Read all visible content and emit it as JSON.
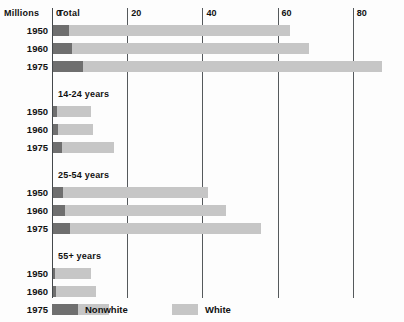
{
  "axis": {
    "unit_label": "Millions",
    "ticks": [
      {
        "label": "0",
        "value": 0
      },
      {
        "label": "20",
        "value": 20
      },
      {
        "label": "40",
        "value": 40
      },
      {
        "label": "60",
        "value": 60
      },
      {
        "label": "80",
        "value": 80
      }
    ]
  },
  "legend": {
    "items": [
      {
        "label": "Nonwhite",
        "color": "#6f6f6f"
      },
      {
        "label": "White",
        "color": "#c6c6c6"
      }
    ]
  },
  "groups": [
    {
      "title": "Total",
      "rows": [
        {
          "label": "1950",
          "nonwhite": 4.3,
          "white": 58.7,
          "total": 63.0
        },
        {
          "label": "1960",
          "nonwhite": 5.0,
          "white": 63.0,
          "total": 68.0
        },
        {
          "label": "1975",
          "nonwhite": 8.0,
          "white": 79.5,
          "total": 87.5
        }
      ]
    },
    {
      "title": "14-24 years",
      "rows": [
        {
          "label": "1950",
          "nonwhite": 1.1,
          "white": 9.0,
          "total": 10.1
        },
        {
          "label": "1960",
          "nonwhite": 1.2,
          "white": 9.4,
          "total": 10.6
        },
        {
          "label": "1975",
          "nonwhite": 2.4,
          "white": 13.8,
          "total": 16.2
        }
      ]
    },
    {
      "title": "25-54 years",
      "rows": [
        {
          "label": "1950",
          "nonwhite": 2.7,
          "white": 38.5,
          "total": 41.2
        },
        {
          "label": "1960",
          "nonwhite": 3.1,
          "white": 42.9,
          "total": 46.0
        },
        {
          "label": "1975",
          "nonwhite": 4.4,
          "white": 50.9,
          "total": 55.3
        }
      ]
    },
    {
      "title": "55+ years",
      "rows": [
        {
          "label": "1950",
          "nonwhite": 0.6,
          "white": 9.5,
          "total": 10.1
        },
        {
          "label": "1960",
          "nonwhite": 0.8,
          "white": 10.7,
          "total": 11.5
        },
        {
          "label": "1975",
          "nonwhite": 0.9,
          "white": 14.0,
          "total": 14.9
        }
      ]
    }
  ],
  "chart_data": {
    "type": "bar",
    "orientation": "horizontal",
    "stacked": true,
    "title": "",
    "xlabel": "Millions",
    "ylabel": "",
    "xlim": [
      0,
      94
    ],
    "xticks": [
      0,
      20,
      40,
      60,
      80
    ],
    "grid": "vertical",
    "legend_position": "bottom-left",
    "series": [
      {
        "name": "Nonwhite",
        "color": "#6f6f6f"
      },
      {
        "name": "White",
        "color": "#c6c6c6"
      }
    ],
    "group_labels": [
      "Total",
      "14-24 years",
      "25-54 years",
      "55+ years"
    ],
    "categories": [
      "Total 1950",
      "Total 1960",
      "Total 1975",
      "14-24 years 1950",
      "14-24 years 1960",
      "14-24 years 1975",
      "25-54 years 1950",
      "25-54 years 1960",
      "25-54 years 1975",
      "55+ years 1950",
      "55+ years 1960",
      "55+ years 1975"
    ],
    "values": {
      "Nonwhite": [
        4.3,
        5.0,
        8.0,
        1.1,
        1.2,
        2.4,
        2.7,
        3.1,
        4.4,
        0.6,
        0.8,
        0.9
      ],
      "White": [
        58.7,
        63.0,
        79.5,
        9.0,
        9.4,
        13.8,
        38.5,
        42.9,
        50.9,
        9.5,
        10.7,
        14.0
      ]
    },
    "totals": [
      63.0,
      68.0,
      87.5,
      10.1,
      10.6,
      16.2,
      41.2,
      46.0,
      55.3,
      10.1,
      11.5,
      14.9
    ]
  },
  "layout": {
    "plot_left": 52,
    "plot_top": 8,
    "px_per_unit": 3.76,
    "row_height": 11,
    "row_gap": 7,
    "group_title_height": 17,
    "group_gap": 10
  }
}
